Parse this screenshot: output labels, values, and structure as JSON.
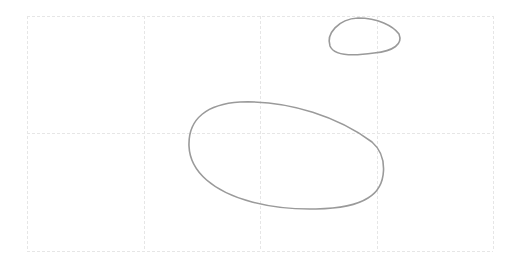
{
  "canvas": {
    "width": 515,
    "height": 267,
    "background": "#ffffff"
  },
  "grid": {
    "color": "#e6e6e6",
    "stroke_width": 1,
    "dash": "3,2",
    "x_lines": [
      27,
      144,
      260,
      377,
      493
    ],
    "y_lines": [
      16,
      133,
      251
    ]
  },
  "shapes": [
    {
      "name": "large-ellipse-sketch",
      "stroke": "#9a9a9a",
      "stroke_width": 1.6,
      "path": "M 240 102 C 290 100, 340 118, 372 142 C 388 156, 388 186, 368 198 C 346 212, 290 212, 252 202 C 214 192, 190 172, 189 146 C 188 118, 208 104, 240 102 Z"
    },
    {
      "name": "small-ellipse-sketch",
      "stroke": "#9a9a9a",
      "stroke_width": 1.6,
      "path": "M 358 18 C 378 18, 393 26, 399 34 C 403 44, 394 51, 374 53 C 354 56, 334 56, 330 46 C 326 34, 338 19, 358 18 Z"
    }
  ]
}
